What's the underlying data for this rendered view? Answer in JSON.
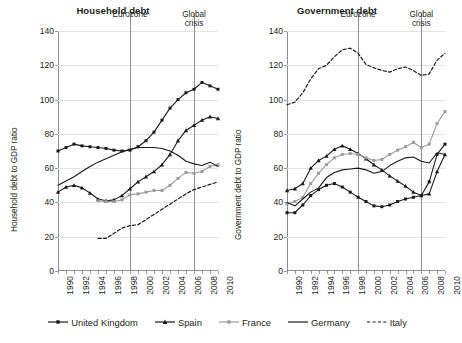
{
  "figure": {
    "legend": {
      "position": "bottom",
      "entries": [
        {
          "label": "United Kingdom",
          "color": "#1a1a1a",
          "marker": "square",
          "dash": "solid"
        },
        {
          "label": "Spain",
          "color": "#1a1a1a",
          "marker": "triangle",
          "dash": "solid"
        },
        {
          "label": "France",
          "color": "#9b9b9b",
          "marker": "square",
          "dash": "solid"
        },
        {
          "label": "Germany",
          "color": "#1a1a1a",
          "marker": "none",
          "dash": "solid"
        },
        {
          "label": "Italy",
          "color": "#1a1a1a",
          "marker": "none",
          "dash": "dashed"
        }
      ]
    }
  },
  "chart_data": [
    {
      "type": "line",
      "title": "Household debt",
      "xlabel": "",
      "ylabel": "Household debt to GDP ratio",
      "xlim": [
        1990,
        2010
      ],
      "ylim": [
        0,
        140
      ],
      "yticks": [
        0,
        20,
        40,
        60,
        80,
        100,
        120,
        140
      ],
      "xticks": [
        1990,
        1992,
        1994,
        1996,
        1998,
        2000,
        2002,
        2004,
        2006,
        2008,
        2010
      ],
      "grid": true,
      "x": [
        1990,
        1991,
        1992,
        1993,
        1994,
        1995,
        1996,
        1997,
        1998,
        1999,
        2000,
        2001,
        2002,
        2003,
        2004,
        2005,
        2006,
        2007,
        2008,
        2009,
        2010
      ],
      "annotations": [
        {
          "text": "Eurozone",
          "x": 1999
        },
        {
          "text": "Global\ncrisis",
          "x": 2007
        }
      ],
      "series": [
        {
          "name": "United Kingdom",
          "color": "#1a1a1a",
          "marker": "square",
          "dash": "solid",
          "values": [
            70,
            72,
            74,
            73,
            72.5,
            72,
            71.5,
            70.5,
            70,
            70.5,
            72.5,
            76,
            81,
            88,
            95,
            100,
            104,
            106,
            110,
            108,
            106
          ]
        },
        {
          "name": "Spain",
          "color": "#1a1a1a",
          "marker": "triangle",
          "dash": "solid",
          "values": [
            46,
            49,
            50,
            48.5,
            45.5,
            42,
            41,
            41.5,
            44,
            48,
            52,
            55,
            58,
            62,
            68,
            76,
            82,
            85,
            88,
            90,
            89
          ]
        },
        {
          "name": "France",
          "color": "#9b9b9b",
          "marker": "square",
          "dash": "solid",
          "values": [
            null,
            null,
            null,
            null,
            null,
            41,
            40.5,
            40.5,
            41.5,
            44.5,
            45,
            46,
            47,
            47,
            50,
            54,
            57.5,
            57,
            58,
            61,
            62
          ]
        },
        {
          "name": "Germany",
          "color": "#1a1a1a",
          "marker": "none",
          "dash": "solid",
          "values": [
            50,
            52.5,
            55,
            58,
            61,
            63.5,
            65.5,
            67.5,
            69.5,
            71,
            72,
            72,
            72,
            71.5,
            70,
            67.5,
            64,
            62.5,
            61.5,
            63.5,
            61
          ]
        },
        {
          "name": "Italy",
          "color": "#1a1a1a",
          "marker": "none",
          "dash": "dashed",
          "values": [
            null,
            null,
            null,
            null,
            null,
            19,
            19,
            22,
            25,
            26.5,
            27,
            30,
            33,
            36,
            39,
            42,
            45,
            47.5,
            49,
            50.5,
            52
          ]
        }
      ]
    },
    {
      "type": "line",
      "title": "Government debt",
      "xlabel": "",
      "ylabel": "Government debt to GDP ratio",
      "xlim": [
        1990,
        2010
      ],
      "ylim": [
        0,
        140
      ],
      "yticks": [
        0,
        20,
        40,
        60,
        80,
        100,
        120,
        140
      ],
      "xticks": [
        1990,
        1992,
        1994,
        1996,
        1998,
        2000,
        2002,
        2004,
        2006,
        2008,
        2010
      ],
      "grid": true,
      "x": [
        1990,
        1991,
        1992,
        1993,
        1994,
        1995,
        1996,
        1997,
        1998,
        1999,
        2000,
        2001,
        2002,
        2003,
        2004,
        2005,
        2006,
        2007,
        2008,
        2009,
        2010
      ],
      "annotations": [
        {
          "text": "Eurozone",
          "x": 1999
        },
        {
          "text": "Global\ncrisis",
          "x": 2007
        }
      ],
      "series": [
        {
          "name": "United Kingdom",
          "color": "#1a1a1a",
          "marker": "square",
          "dash": "solid",
          "values": [
            34,
            34,
            38.5,
            44,
            47.5,
            50,
            51,
            49,
            46,
            43,
            40.5,
            38,
            37.5,
            38.5,
            40.5,
            42,
            43,
            44,
            52,
            68,
            74
          ]
        },
        {
          "name": "Spain",
          "color": "#1a1a1a",
          "marker": "triangle",
          "dash": "solid",
          "values": [
            47,
            48,
            51,
            60,
            64.5,
            67,
            71,
            73,
            71,
            68.5,
            65.5,
            62,
            59,
            55.5,
            52.5,
            49.5,
            46,
            44,
            45,
            58,
            68
          ]
        },
        {
          "name": "France",
          "color": "#9b9b9b",
          "marker": "square",
          "dash": "solid",
          "values": [
            39,
            40.5,
            43,
            51,
            57,
            62,
            66,
            68,
            68.5,
            68,
            66,
            64.5,
            65,
            68,
            70.5,
            72.5,
            75,
            72,
            74,
            86,
            93
          ]
        },
        {
          "name": "Germany",
          "color": "#1a1a1a",
          "marker": "none",
          "dash": "solid",
          "values": [
            40,
            38,
            42,
            46,
            48.5,
            54.5,
            57.5,
            59,
            59.5,
            60,
            59,
            57,
            58,
            61.5,
            64,
            66,
            66.5,
            64,
            63,
            69,
            68
          ]
        },
        {
          "name": "Italy",
          "color": "#1a1a1a",
          "marker": "none",
          "dash": "dashed",
          "values": [
            97,
            98.5,
            104,
            112,
            118,
            120,
            125,
            129,
            130,
            127,
            120.5,
            118.5,
            117,
            116,
            118,
            119,
            117,
            114,
            115,
            123,
            127
          ]
        }
      ]
    }
  ]
}
